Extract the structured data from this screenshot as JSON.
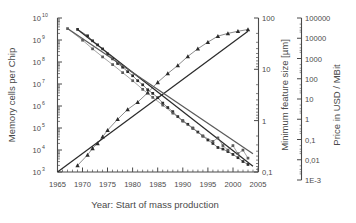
{
  "figure": {
    "background": "#ffffff",
    "axis_color": "#4a4a4a",
    "series_color_dark": "#2b2b2b",
    "series_color_mid": "#5a5a5a"
  },
  "axes": {
    "x": {
      "label": "Year: Start of mass production",
      "ticks": [
        "1965",
        "1970",
        "1975",
        "1980",
        "1985",
        "1990",
        "1995",
        "2000",
        "2005"
      ],
      "min": 1965,
      "max": 2005
    },
    "y_left": {
      "label": "Memory cells per Chip",
      "base": "10",
      "exponents": [
        "3",
        "4",
        "5",
        "6",
        "7",
        "8",
        "9",
        "10"
      ],
      "min_exp": 3,
      "max_exp": 10
    },
    "y_right_1": {
      "label": "Minimum feature size [µm]",
      "ticks": [
        "100",
        "10",
        "1",
        "0,1"
      ],
      "min_exp": -1,
      "max_exp": 2
    },
    "y_right_2": {
      "label": "Price in USD / MBit",
      "ticks": [
        "100000",
        "10000",
        "1000",
        "100",
        "10",
        "1",
        "0,1",
        "0,01",
        "1E-3"
      ],
      "min_exp": -3,
      "max_exp": 5
    }
  },
  "chart_data": {
    "type": "scatter",
    "title": "",
    "xlabel": "Year: Start of mass production",
    "ylabel": "Memory cells per Chip",
    "ylabel_right_1": "Minimum feature size [µm]",
    "ylabel_right_2": "Price in USD / MBit",
    "xlim": [
      1965,
      2005
    ],
    "ylim_left_log10": [
      3,
      10
    ],
    "ylim_right1_log10": [
      -1,
      2
    ],
    "ylim_right2_log10": [
      -3,
      5
    ],
    "grid": false,
    "legend": "none",
    "series": [
      {
        "name": "Memory cells per Chip",
        "axis": "y_left",
        "marker": "triangle",
        "trendline": true,
        "trend_start": [
          1965,
          1000
        ],
        "trend_end": [
          2003,
          2500000000
        ],
        "x": [
          1969,
          1971,
          1972,
          1973,
          1974,
          1975,
          1977,
          1979,
          1981,
          1983,
          1985,
          1987,
          1989,
          1991,
          1993,
          1995,
          1997,
          1999,
          2001,
          2003
        ],
        "y": [
          2000,
          6000,
          12000,
          20000,
          40000,
          80000,
          250000,
          700000,
          1500000,
          4000000,
          12000000,
          30000000,
          70000000,
          180000000,
          400000000,
          800000000,
          1500000000,
          2000000000,
          2500000000,
          3000000000
        ]
      },
      {
        "name": "Minimum feature size",
        "axis": "y_right_1",
        "marker": "square",
        "trendline": true,
        "trend_start": [
          1969,
          60
        ],
        "trend_end": [
          2004,
          0.13
        ],
        "x": [
          1969,
          1971,
          1972,
          1973,
          1974,
          1975,
          1976,
          1977,
          1978,
          1979,
          1980,
          1981,
          1982,
          1983,
          1984,
          1985,
          1986,
          1987,
          1988,
          1989,
          1990,
          1991,
          1992,
          1993,
          1994,
          1995,
          1996,
          1997,
          1998,
          1999,
          2000,
          2001,
          2002,
          2003
        ],
        "y": [
          60,
          45,
          36,
          30,
          25,
          20,
          16,
          13,
          11,
          9,
          7.5,
          6,
          5,
          4,
          3.4,
          2.8,
          2.2,
          1.8,
          1.5,
          1.2,
          1.0,
          0.85,
          0.72,
          0.6,
          0.5,
          0.42,
          0.36,
          0.3,
          0.28,
          0.25,
          0.22,
          0.19,
          0.16,
          0.14
        ]
      },
      {
        "name": "Price in USD / MBit",
        "axis": "y_right_2",
        "marker": "square",
        "trendline": true,
        "trend_start": [
          1967,
          30000
        ],
        "trend_end": [
          2004,
          0.02
        ],
        "x": [
          1967,
          1970,
          1972,
          1974,
          1976,
          1978,
          1980,
          1982,
          1984,
          1986,
          1988,
          1990,
          1992,
          1994,
          1996,
          1997,
          1998,
          1999,
          2000,
          2001,
          2002,
          2003
        ],
        "y": [
          30000,
          8000,
          3000,
          1200,
          500,
          200,
          80,
          30,
          12,
          5,
          2,
          0.8,
          0.35,
          0.15,
          0.08,
          0.12,
          0.05,
          0.03,
          0.05,
          0.02,
          0.03,
          0.012
        ]
      }
    ]
  }
}
